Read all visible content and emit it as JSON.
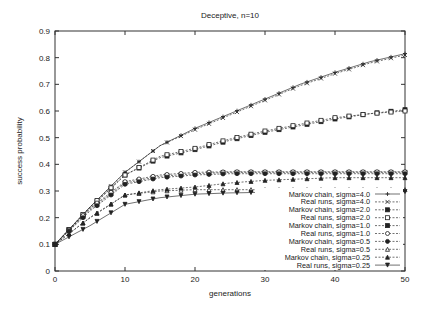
{
  "chart_data": {
    "type": "line",
    "title": "Deceptive, n=10",
    "xlabel": "generations",
    "ylabel": "success probability",
    "xlim": [
      0,
      50
    ],
    "ylim": [
      0,
      0.9
    ],
    "xticks": [
      0,
      10,
      20,
      30,
      40,
      50
    ],
    "yticks": [
      0,
      0.1,
      0.2,
      0.3,
      0.4,
      0.5,
      0.6,
      0.7,
      0.8,
      0.9
    ],
    "ytick_labels": [
      "0",
      "0.1",
      "0.2",
      "0.3",
      "0.4",
      "0.5",
      "0.6",
      "0.7",
      "0.8",
      "0.9"
    ],
    "grid": false,
    "legend_position": "lower right",
    "x": [
      0,
      5,
      10,
      15,
      20,
      25,
      30,
      35,
      40,
      45,
      50
    ],
    "series": [
      {
        "name": "Markov chain, sigma=4.0",
        "marker": "plus",
        "dash": "solid",
        "values": [
          0.1,
          0.24,
          0.37,
          0.47,
          0.535,
          0.59,
          0.645,
          0.7,
          0.745,
          0.785,
          0.815
        ]
      },
      {
        "name": "Real runs, sigma=4.0",
        "marker": "cross",
        "dash": "dashed",
        "values": [
          0.1,
          0.24,
          0.37,
          0.47,
          0.53,
          0.585,
          0.64,
          0.695,
          0.74,
          0.78,
          0.81
        ]
      },
      {
        "name": "Markov chain, sigma=2.0",
        "marker": "filled-square",
        "dash": "dashed",
        "values": [
          0.1,
          0.235,
          0.36,
          0.425,
          0.455,
          0.49,
          0.52,
          0.545,
          0.57,
          0.59,
          0.605
        ]
      },
      {
        "name": "Real runs, sigma=2.0",
        "marker": "open-square",
        "dash": "dashed",
        "values": [
          0.1,
          0.24,
          0.36,
          0.43,
          0.46,
          0.495,
          0.525,
          0.55,
          0.575,
          0.59,
          0.6
        ]
      },
      {
        "name": "Markov chain, sigma=1.0",
        "marker": "filled-square",
        "dash": "dashed",
        "values": [
          0.1,
          0.23,
          0.33,
          0.355,
          0.365,
          0.37,
          0.37,
          0.37,
          0.37,
          0.37,
          0.37
        ]
      },
      {
        "name": "Real runs, sigma=1.0",
        "marker": "open-circle",
        "dash": "dashed",
        "values": [
          0.1,
          0.235,
          0.335,
          0.36,
          0.37,
          0.372,
          0.372,
          0.372,
          0.372,
          0.372,
          0.372
        ]
      },
      {
        "name": "Markov chain, sigma=0.5",
        "marker": "filled-circle",
        "dash": "dashed",
        "values": [
          0.1,
          0.225,
          0.325,
          0.35,
          0.36,
          0.365,
          0.365,
          0.365,
          0.365,
          0.365,
          0.365
        ]
      },
      {
        "name": "Real runs, sigma=0.5",
        "marker": "open-triangle",
        "dash": "dashed",
        "values": [
          0.1,
          0.2,
          0.285,
          0.3,
          0.305,
          0.305,
          0.305,
          0.305,
          0.305,
          0.305,
          0.305
        ]
      },
      {
        "name": "Markov chain, sigma=0.25",
        "marker": "filled-triangle",
        "dash": "dashed",
        "values": [
          0.1,
          0.2,
          0.285,
          0.305,
          0.315,
          0.33,
          0.34,
          0.345,
          0.35,
          0.35,
          0.35
        ]
      },
      {
        "name": "Real runs, sigma=0.25",
        "marker": "inverted-triangle",
        "dash": "solid",
        "values": [
          0.1,
          0.17,
          0.25,
          0.275,
          0.288,
          0.293,
          0.295,
          0.297,
          0.298,
          0.298,
          0.298
        ]
      }
    ]
  }
}
